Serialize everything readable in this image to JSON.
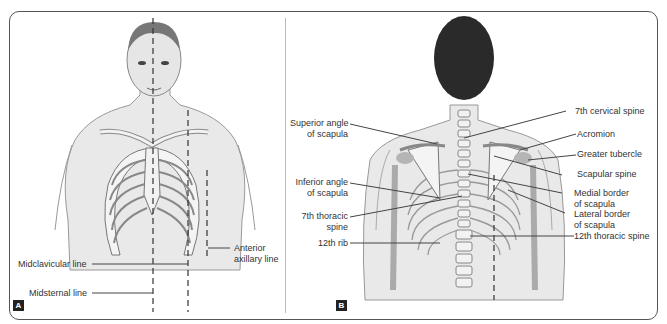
{
  "panel_a": {
    "badge": "A",
    "labels": {
      "anterior_axillary": [
        "Anterior",
        "axillary line"
      ],
      "midclavicular": "Midclavicular line",
      "midsternal": "Midsternal line"
    }
  },
  "panel_b": {
    "badge": "B",
    "labels": {
      "superior_angle": [
        "Superior angle",
        "of scapula"
      ],
      "inferior_angle": [
        "Inferior angle",
        "of scapula"
      ],
      "thoracic7": [
        "7th thoracic",
        "spine"
      ],
      "rib12": "12th rib",
      "cervical7": "7th cervical spine",
      "acromion": "Acromion",
      "greater_tubercle": "Greater tubercle",
      "scapular_spine": "Scapular spine",
      "medial_border": [
        "Medial border",
        "of scapula"
      ],
      "lateral_border": [
        "Lateral border",
        "of scapula"
      ],
      "thoracic12": "12th thoracic spine"
    }
  },
  "colors": {
    "skin": "#e9e9e9",
    "outline": "#777",
    "hair": "#2a2a2a",
    "bone": "#f4f4f4",
    "cartilage": "#b5b5b5"
  }
}
